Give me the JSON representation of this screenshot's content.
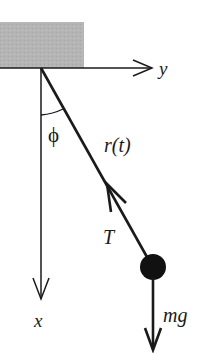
{
  "diagram": {
    "type": "pendulum-free-body",
    "colors": {
      "ceiling": "#b3b3b3",
      "line": "#1a1a1a",
      "bob": "#111111",
      "background": "#ffffff"
    },
    "axes": {
      "horizontal_label": "y",
      "vertical_label": "x"
    },
    "labels": {
      "angle": "ϕ",
      "length": "r(t)",
      "tension": "T",
      "weight": "mg"
    }
  }
}
